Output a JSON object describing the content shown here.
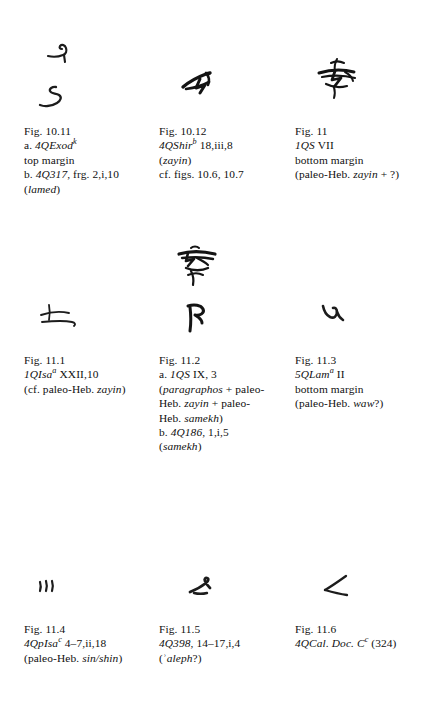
{
  "page": {
    "kind": "paleography-figure-plate",
    "ink_color": "#1a1a1a",
    "background": "#ffffff"
  },
  "figures": [
    {
      "id": "fig-10-11",
      "glyph_names": [
        "paleo-hebrew-lamed-glyph-a",
        "paleo-hebrew-lamed-glyph-b"
      ],
      "caption": {
        "line1": "Fig. 10.11",
        "line2_prefix": "a. ",
        "line2_italic": "4QExod",
        "line2_sup": "k",
        "line3": "top margin",
        "line4_prefix": "b. ",
        "line4_italic": "4Q317",
        "line4_rest": ", frg. 2,i,10",
        "line5_open": "(",
        "line5_italic": "lamed",
        "line5_close": ")"
      }
    },
    {
      "id": "fig-10-12",
      "glyph_names": [
        "paleo-hebrew-zayin-glyph"
      ],
      "caption": {
        "line1": "Fig. 10.12",
        "line2_italic": "4QShir",
        "line2_sup": "b",
        "line2_rest": " 18,iii,8",
        "line3_open": "(",
        "line3_italic": "zayin",
        "line3_close": ")",
        "line4": "cf. figs. 10.6, 10.7"
      }
    },
    {
      "id": "fig-11",
      "glyph_names": [
        "paleo-hebrew-zayin-cluster-glyph"
      ],
      "caption": {
        "line1": "Fig. 11",
        "line2_italic": "1QS",
        "line2_rest": " VII",
        "line3": "bottom margin",
        "line4_prefix": "(paleo-Heb. ",
        "line4_italic": "zayin",
        "line4_rest": " + ?)"
      }
    },
    {
      "id": "fig-11-1",
      "glyph_names": [
        "paleo-hebrew-zayin-cursive-glyph"
      ],
      "caption": {
        "line1": "Fig. 11.1",
        "line2_italic": "1QIsa",
        "line2_sup": "a",
        "line2_rest": " XXII,10",
        "line3_prefix": "(cf. paleo-Heb. ",
        "line3_italic": "zayin",
        "line3_close": ")"
      }
    },
    {
      "id": "fig-11-2",
      "glyph_names": [
        "paragraphos-zayin-samekh-cluster-glyph",
        "paleo-hebrew-samekh-glyph"
      ],
      "caption": {
        "line1": "Fig. 11.2",
        "line2_prefix": "a. ",
        "line2_italic": "1QS",
        "line2_rest": " IX, 3",
        "line3_open": "(",
        "line3_italic": "paragraphos",
        "line3_rest": " + paleo-",
        "line4_prefix": "Heb. ",
        "line4_italic": "zayin",
        "line4_rest": " + paleo-",
        "line5_prefix": "Heb. ",
        "line5_italic": "samekh",
        "line5_close": ")",
        "line6_prefix": "b. ",
        "line6_italic": "4Q186",
        "line6_rest": ", 1,i,5",
        "line7_open": "(",
        "line7_italic": "samekh",
        "line7_close": ")"
      }
    },
    {
      "id": "fig-11-3",
      "glyph_names": [
        "paleo-hebrew-waw-glyph"
      ],
      "caption": {
        "line1": "Fig. 11.3",
        "line2_italic": "5QLam",
        "line2_sup": "a",
        "line2_rest": " II",
        "line3": "bottom margin",
        "line4_prefix": "(paleo-Heb. ",
        "line4_italic": "waw",
        "line4_rest": "?)"
      }
    },
    {
      "id": "fig-11-4",
      "glyph_names": [
        "paleo-hebrew-sin-shin-glyph"
      ],
      "caption": {
        "line1": "Fig. 11.4",
        "line2_italic": "4QpIsa",
        "line2_sup": "c",
        "line2_rest": " 4–7,ii,18",
        "line3_prefix": "(paleo-Heb. ",
        "line3_italic": "sin/shin",
        "line3_close": ")"
      }
    },
    {
      "id": "fig-11-5",
      "glyph_names": [
        "paleo-hebrew-aleph-glyph"
      ],
      "caption": {
        "line1": "Fig. 11.5",
        "line2_italic": "4Q398",
        "line2_rest": ", 14–17,i,4",
        "line3_open": "(ʾ",
        "line3_italic": "aleph",
        "line3_rest": "?)"
      }
    },
    {
      "id": "fig-11-6",
      "glyph_names": [
        "paleo-hebrew-angle-glyph"
      ],
      "caption": {
        "line1": "Fig. 11.6",
        "line2_italic": "4QCal. Doc. C",
        "line2_sup": "c",
        "line2_rest": " (324)"
      }
    }
  ]
}
